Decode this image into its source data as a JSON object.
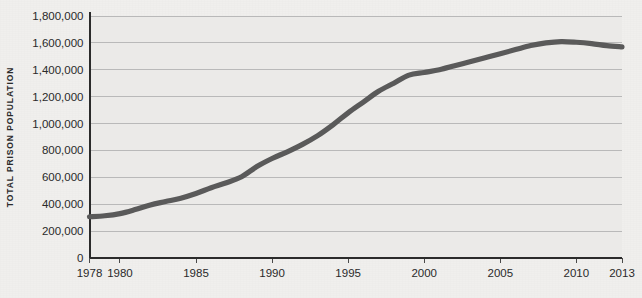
{
  "chart_data": {
    "type": "line",
    "title": "",
    "xlabel": "",
    "ylabel": "TOTAL PRISON POPULATION",
    "xlim": [
      1978,
      2013
    ],
    "ylim": [
      0,
      1800000
    ],
    "grid": true,
    "legend_position": "none",
    "line_color": "#5a5a5a",
    "background_color": "#f0efed",
    "plot_background_color": "#ebeae8",
    "axis_color": "#2b2b2b",
    "gridline_color": "#b9b9b9",
    "x_tick_labels": [
      "1978",
      "1980",
      "1985",
      "1990",
      "1995",
      "2000",
      "2005",
      "2010",
      "2013"
    ],
    "x_tick_values": [
      1978,
      1980,
      1985,
      1990,
      1995,
      2000,
      2005,
      2010,
      2013
    ],
    "y_tick_labels": [
      "0",
      "200,000",
      "400,000",
      "600,000",
      "800,000",
      "1,000,000",
      "1,200,000",
      "1,400,000",
      "1,600,000",
      "1,800,000"
    ],
    "y_tick_values": [
      0,
      200000,
      400000,
      600000,
      800000,
      1000000,
      1200000,
      1400000,
      1600000,
      1800000
    ],
    "x": [
      1978,
      1979,
      1980,
      1981,
      1982,
      1983,
      1984,
      1985,
      1986,
      1987,
      1988,
      1989,
      1990,
      1991,
      1992,
      1993,
      1994,
      1995,
      1996,
      1997,
      1998,
      1999,
      2000,
      2001,
      2002,
      2003,
      2004,
      2005,
      2006,
      2007,
      2008,
      2009,
      2010,
      2011,
      2012,
      2013
    ],
    "values": [
      307000,
      314000,
      330000,
      360000,
      395000,
      420000,
      445000,
      480000,
      523000,
      560000,
      604000,
      680000,
      740000,
      790000,
      845000,
      910000,
      990000,
      1080000,
      1160000,
      1240000,
      1300000,
      1360000,
      1380000,
      1400000,
      1430000,
      1460000,
      1490000,
      1520000,
      1550000,
      1580000,
      1600000,
      1610000,
      1605000,
      1595000,
      1580000,
      1570000
    ],
    "series": [
      {
        "name": "Total prison population",
        "values": [
          307000,
          314000,
          330000,
          360000,
          395000,
          420000,
          445000,
          480000,
          523000,
          560000,
          604000,
          680000,
          740000,
          790000,
          845000,
          910000,
          990000,
          1080000,
          1160000,
          1240000,
          1300000,
          1360000,
          1380000,
          1400000,
          1430000,
          1460000,
          1490000,
          1520000,
          1550000,
          1580000,
          1600000,
          1610000,
          1605000,
          1595000,
          1580000,
          1570000
        ]
      }
    ]
  }
}
